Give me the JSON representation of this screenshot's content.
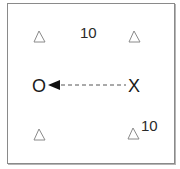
{
  "diagram": {
    "type": "play-diagram",
    "cones": [
      {
        "id": "cone-top-left",
        "x": 39,
        "y": 36
      },
      {
        "id": "cone-top-right",
        "x": 134,
        "y": 36
      },
      {
        "id": "cone-bottom-left",
        "x": 39,
        "y": 134
      },
      {
        "id": "cone-bottom-right",
        "x": 133,
        "y": 133
      }
    ],
    "players": {
      "o_label": "O",
      "x_label": "X"
    },
    "distance_labels": {
      "top": "10",
      "right": "10"
    },
    "pass": {
      "from": "X",
      "to": "O",
      "style": "dashed",
      "arrow": "arrow-left"
    },
    "colors": {
      "line": "#444444",
      "cone": "#8a8a8a",
      "border": "#8a8a8a"
    }
  }
}
